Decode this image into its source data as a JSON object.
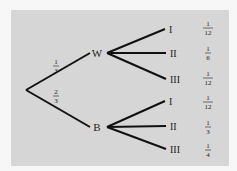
{
  "diagram": {
    "type": "probability-tree",
    "root_branches": [
      {
        "node": "W",
        "probability": {
          "num": "1",
          "den": "3"
        }
      },
      {
        "node": "B",
        "probability": {
          "num": "2",
          "den": "3"
        }
      }
    ],
    "W_children": [
      {
        "label": "I",
        "joint": {
          "num": "1",
          "den": "12"
        }
      },
      {
        "label": "II",
        "joint": {
          "num": "1",
          "den": "6"
        }
      },
      {
        "label": "III",
        "joint": {
          "num": "1",
          "den": "12"
        }
      }
    ],
    "B_children": [
      {
        "label": "I",
        "joint": {
          "num": "1",
          "den": "12"
        }
      },
      {
        "label": "II",
        "joint": {
          "num": "1",
          "den": "3"
        }
      },
      {
        "label": "III",
        "joint": {
          "num": "1",
          "den": "4"
        }
      }
    ],
    "colors": {
      "background": "#f7f7f7",
      "panel": "#d6d6d6",
      "line": "#111111",
      "text": "#222222"
    }
  }
}
